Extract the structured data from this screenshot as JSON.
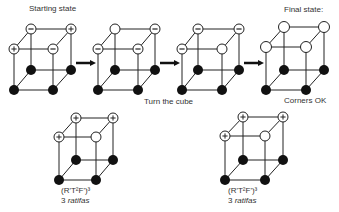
{
  "labels": {
    "starting_state": "Starting state",
    "final_state": "Final state:",
    "turn_the_cube": "Turn the cube",
    "corners_ok": "Corners OK",
    "formula_left": "(R'T²F')³",
    "count_left_num": "3",
    "count_left_word": "ratifas",
    "formula_right": "(R'T²F')³",
    "count_right_num": "3",
    "count_right_word": "ratifas"
  },
  "legend": {
    "plus": "+",
    "minus": "−",
    "open": "",
    "filled": ""
  },
  "colors": {
    "line": "#222222",
    "fill_dark": "#111111",
    "fill_open": "#ffffff"
  },
  "cubes": [
    {
      "id": "start",
      "top_corners": {
        "back_left": "minus",
        "back_right": "plus",
        "front_left": "plus",
        "front_right": "minus"
      }
    },
    {
      "id": "step2",
      "top_corners": {
        "back_left": "open",
        "back_right": "minus",
        "front_left": "minus",
        "front_right": "minus"
      }
    },
    {
      "id": "step3",
      "top_corners": {
        "back_left": "minus",
        "back_right": "minus",
        "front_left": "minus",
        "front_right": "open"
      }
    },
    {
      "id": "final",
      "top_corners": {
        "back_left": "open",
        "back_right": "open",
        "front_left": "open",
        "front_right": "open"
      }
    },
    {
      "id": "alg-left",
      "top_corners": {
        "back_left": "plus",
        "back_right": "plus",
        "front_left": "plus",
        "front_right": "open"
      }
    },
    {
      "id": "alg-right",
      "top_corners": {
        "back_left": "plus",
        "back_right": "plus",
        "front_left": "plus",
        "front_right": "open"
      }
    }
  ]
}
